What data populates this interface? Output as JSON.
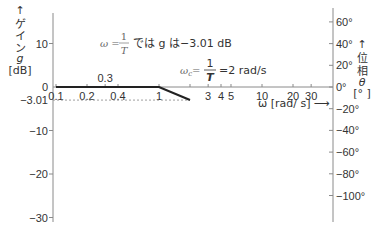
{
  "chart_data": {
    "type": "line",
    "title": "",
    "xscale": "log",
    "xlim": [
      0.1,
      40
    ],
    "x_tick_labels": [
      {
        "value": 0.1,
        "label": "0.1",
        "row": "below"
      },
      {
        "value": 0.2,
        "label": "0.2",
        "row": "below"
      },
      {
        "value": 0.3,
        "label": "0.3",
        "row": "above"
      },
      {
        "value": 0.4,
        "label": "0.4",
        "row": "below"
      },
      {
        "value": 1,
        "label": "1",
        "row": "below"
      },
      {
        "value": 3,
        "label": "3",
        "row": "below"
      },
      {
        "value": 4,
        "label": "4",
        "row": "below"
      },
      {
        "value": 5,
        "label": "5",
        "row": "below"
      },
      {
        "value": 10,
        "label": "10",
        "row": "below"
      },
      {
        "value": 20,
        "label": "20",
        "row": "below"
      },
      {
        "value": 30,
        "label": "30",
        "row": "below"
      }
    ],
    "x_minor_ticks": [
      0.1,
      0.2,
      0.3,
      0.4,
      1,
      2,
      3,
      4,
      5,
      10,
      20,
      30
    ],
    "xlabel": "ω [rad/ s] ⟶",
    "y_left": {
      "label_lines": [
        "↑",
        "ゲ",
        "イ",
        "ン",
        "g",
        "[dB]"
      ],
      "ylim": [
        -30,
        17
      ],
      "ticks": [
        {
          "value": 10,
          "label": "10"
        },
        {
          "value": 0,
          "label": "0"
        },
        {
          "value": -3.01,
          "label": "−3.01"
        },
        {
          "value": -10,
          "label": "−10"
        },
        {
          "value": -20,
          "label": "−20"
        },
        {
          "value": -30,
          "label": "−30"
        }
      ]
    },
    "y_right": {
      "label_lines": [
        "↑",
        "位",
        "相",
        "θ",
        "[° ]"
      ],
      "ylim": [
        -120,
        70
      ],
      "ticks": [
        {
          "value": 60,
          "label": "60°"
        },
        {
          "value": 40,
          "label": "40°"
        },
        {
          "value": 20,
          "label": "20°"
        },
        {
          "value": 0,
          "label": "0°"
        },
        {
          "value": -20,
          "label": "−20°"
        },
        {
          "value": -40,
          "label": "−40°"
        },
        {
          "value": -60,
          "label": "−60°"
        },
        {
          "value": -80,
          "label": "−80°"
        },
        {
          "value": -100,
          "label": "−100°"
        }
      ]
    },
    "series": [
      {
        "name": "gain",
        "axis": "left",
        "points": [
          [
            0.1,
            0
          ],
          [
            1,
            0
          ],
          [
            2,
            -3.01
          ]
        ]
      }
    ],
    "reference_line": {
      "axis": "left",
      "value": -3.01,
      "style": "dashed",
      "from_x": 0.1,
      "to_x": 2
    },
    "annotations": {
      "note1": {
        "prefix": "ω =",
        "frac_num": "1",
        "frac_den": "T",
        "text": "では g は−3.01 dB"
      },
      "note2": {
        "prefix": "ω",
        "sub": "c",
        "eq": "=",
        "frac_num": "1",
        "frac_den": "T",
        "text": "=2 rad/s"
      }
    },
    "colors": {
      "gain_line": "#222222",
      "axis": "#8a8a8a",
      "text": "#333333",
      "muted": "#888888"
    }
  }
}
